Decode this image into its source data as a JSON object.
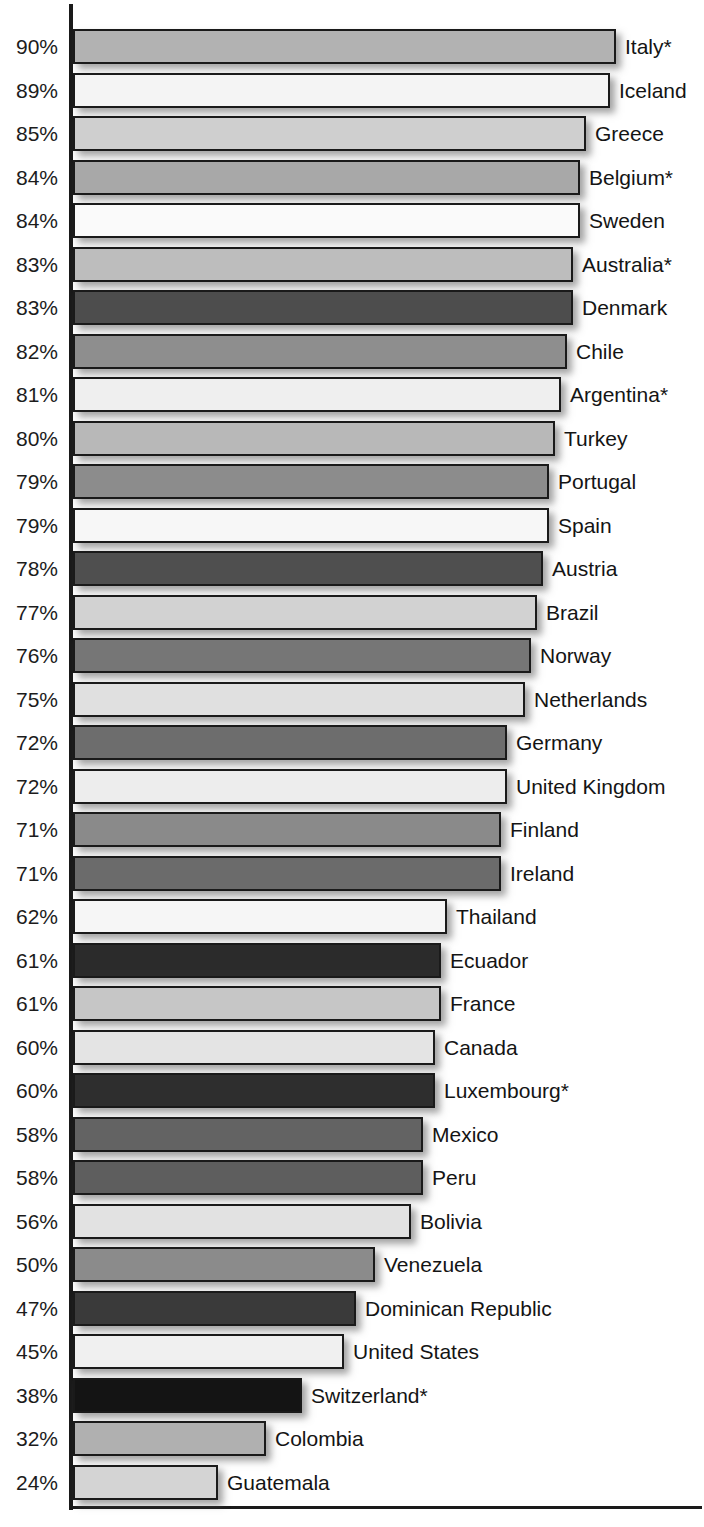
{
  "chart_data": {
    "type": "bar",
    "orientation": "horizontal",
    "title": "",
    "subtitle": "",
    "xlabel": "",
    "ylabel": "",
    "xlim": [
      0,
      100
    ],
    "grid": false,
    "legend": null,
    "value_suffix": "%",
    "footnote_marker": "*",
    "axis_color": "#1a1a1a",
    "background": "#ffffff",
    "categories": [
      "Italy*",
      "Iceland",
      "Greece",
      "Belgium*",
      "Sweden",
      "Australia*",
      "Denmark",
      "Chile",
      "Argentina*",
      "Turkey",
      "Portugal",
      "Spain",
      "Austria",
      "Brazil",
      "Norway",
      "Netherlands",
      "Germany",
      "United Kingdom",
      "Finland",
      "Ireland",
      "Thailand",
      "Ecuador",
      "France",
      "Canada",
      "Luxembourg*",
      "Mexico",
      "Peru",
      "Bolivia",
      "Venezuela",
      "Dominican Republic",
      "United States",
      "Switzerland*",
      "Colombia",
      "Guatemala"
    ],
    "values": [
      90,
      89,
      85,
      84,
      84,
      83,
      83,
      82,
      81,
      80,
      79,
      79,
      78,
      77,
      76,
      75,
      72,
      72,
      71,
      71,
      62,
      61,
      61,
      60,
      60,
      58,
      58,
      56,
      50,
      47,
      45,
      38,
      32,
      24
    ],
    "value_labels": [
      "90%",
      "89%",
      "85%",
      "84%",
      "84%",
      "83%",
      "83%",
      "82%",
      "81%",
      "80%",
      "79%",
      "79%",
      "78%",
      "77%",
      "76%",
      "75%",
      "72%",
      "72%",
      "71%",
      "71%",
      "62%",
      "61%",
      "61%",
      "60%",
      "60%",
      "58%",
      "58%",
      "56%",
      "50%",
      "47%",
      "45%",
      "38%",
      "32%",
      "24%"
    ],
    "bar_colors": [
      "#b2b2b2",
      "#f4f4f4",
      "#cfcfcf",
      "#a8a8a8",
      "#fafafa",
      "#bdbdbd",
      "#4d4d4d",
      "#8e8e8e",
      "#efefef",
      "#b8b8b8",
      "#8c8c8c",
      "#f7f7f7",
      "#4f4f4f",
      "#d2d2d2",
      "#767676",
      "#e0e0e0",
      "#6d6d6d",
      "#ededed",
      "#8a8a8a",
      "#6b6b6b",
      "#f6f6f6",
      "#2b2b2b",
      "#c6c6c6",
      "#e4e4e4",
      "#2e2e2e",
      "#636363",
      "#5e5e5e",
      "#e2e2e2",
      "#8b8b8b",
      "#3a3a3a",
      "#f0f0f0",
      "#141414",
      "#b0b0b0",
      "#d4d4d4"
    ]
  }
}
